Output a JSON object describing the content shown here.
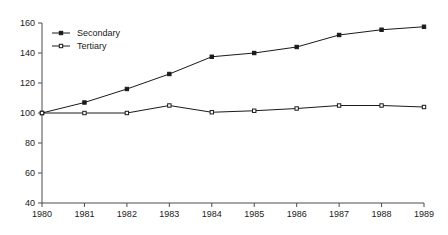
{
  "chart_data": {
    "type": "line",
    "title": "",
    "xlabel": "",
    "ylabel": "",
    "x": [
      1980,
      1981,
      1982,
      1983,
      1984,
      1985,
      1986,
      1987,
      1988,
      1989
    ],
    "xtick_labels": [
      "1980",
      "1981",
      "1982",
      "1983",
      "1984",
      "1985",
      "1986",
      "1987",
      "1988",
      "1989"
    ],
    "ytick_labels": [
      "40",
      "60",
      "80",
      "100",
      "120",
      "140",
      "160"
    ],
    "yticks": [
      40,
      60,
      80,
      100,
      120,
      140,
      160
    ],
    "ylim": [
      40,
      160
    ],
    "xlim": [
      1980,
      1989
    ],
    "grid": false,
    "legend_position": "upper-left-inside",
    "series": [
      {
        "name": "Secondary",
        "marker": "filled-square",
        "values": [
          100,
          107,
          116,
          126,
          137.5,
          140,
          144,
          152,
          155.5,
          157.5
        ]
      },
      {
        "name": "Tertiary",
        "marker": "open-square",
        "values": [
          100,
          100,
          100,
          105,
          100.5,
          101.5,
          103,
          105,
          105,
          104
        ]
      }
    ],
    "colors": {
      "line": "#1a1a1a",
      "marker_fill": "#1a1a1a",
      "marker_open_fill": "#ffffff",
      "axis": "#4d4d4d",
      "background": "#ffffff"
    }
  }
}
